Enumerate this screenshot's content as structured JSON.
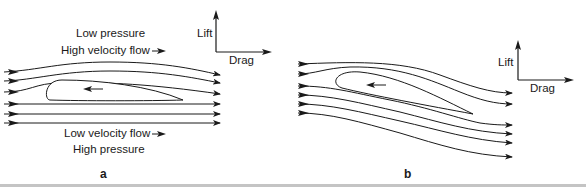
{
  "diagram": {
    "panel_a": {
      "letter": "a",
      "top_label_1": "Low pressure",
      "top_label_2": "High velocity flow",
      "bottom_label_1": "Low velocity flow",
      "bottom_label_2": "High pressure",
      "force_axes": {
        "lift": "Lift",
        "drag": "Drag"
      },
      "streamline_count": 6,
      "airfoil_orientation": "level"
    },
    "panel_b": {
      "letter": "b",
      "force_axes": {
        "lift": "Lift",
        "drag": "Drag"
      },
      "streamline_count": 6,
      "airfoil_orientation": "tilted, angle of attack"
    },
    "colors": {
      "line": "#1a1a1a",
      "rule": "#c4c4c4",
      "background": "#ffffff"
    }
  }
}
